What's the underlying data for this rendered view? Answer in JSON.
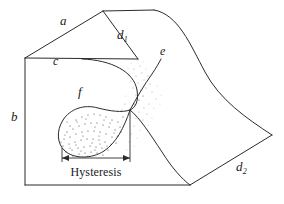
{
  "figure": {
    "stroke_color": "#2b2b2b",
    "stipple_color": "#3a3a3a",
    "background": "#ffffff"
  },
  "labels": {
    "a": "a",
    "d1_base": "d",
    "d1_sub": "1",
    "c": "c",
    "e": "e",
    "f": "f",
    "b": "b",
    "d2_base": "d",
    "d2_sub": "2",
    "hysteresis": "Hysteresis"
  },
  "geometry": {
    "box": {
      "left_vertex": [
        25,
        58
      ],
      "top_left_vertex": [
        103,
        11
      ],
      "top_right_vertex": [
        154,
        10
      ],
      "bottom_left_vertex": [
        25,
        185
      ],
      "bottom_mid_vertex": [
        190,
        185
      ],
      "right_vertex": [
        272,
        135
      ],
      "front_top_right": [
        138,
        59
      ]
    },
    "edges": {
      "a": "left_vertex -> top_left_vertex",
      "c": "left_vertex -> front_top_right",
      "b": "left_vertex -> bottom_left_vertex",
      "d1": "top_left_vertex -> front_top_right",
      "d2": "bottom_mid_vertex -> right_vertex",
      "back_top": "top_left_vertex -> top_right_vertex",
      "bottom": "bottom_left_vertex -> bottom_mid_vertex",
      "right_curved": "top_right_vertex -> right_vertex (S-curve)"
    },
    "cusp_point": [
      130,
      110
    ],
    "hysteresis_span": [
      62,
      130
    ],
    "hysteresis_arrow_y": 158
  }
}
